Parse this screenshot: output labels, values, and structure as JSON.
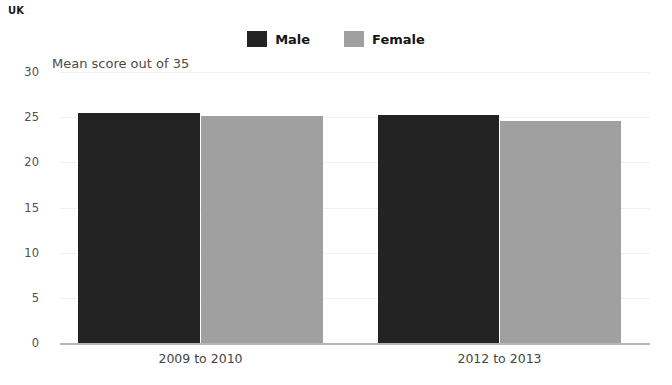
{
  "region_label": "UK",
  "legend": {
    "position": "top-center",
    "entries": [
      {
        "label": "Male",
        "color": "#232323",
        "icon": "square-swatch-icon"
      },
      {
        "label": "Female",
        "color": "#a0a0a0",
        "icon": "square-swatch-icon"
      }
    ]
  },
  "axis_note": "Mean score out of 35",
  "chart_data": {
    "type": "bar",
    "title": "UK",
    "subtitle": "Mean score out of 35",
    "xlabel": "",
    "ylabel": "Mean score out of 35",
    "categories": [
      "2009 to 2010",
      "2012 to 2013"
    ],
    "series": [
      {
        "name": "Male",
        "color": "#232323",
        "values": [
          25.5,
          25.2
        ]
      },
      {
        "name": "Female",
        "color": "#a0a0a0",
        "values": [
          25.1,
          24.6
        ]
      }
    ],
    "ylim": [
      0,
      30
    ],
    "yticks": [
      0,
      5,
      10,
      15,
      20,
      25,
      30
    ],
    "ytick_labels": [
      "0",
      "5",
      "10",
      "15",
      "20",
      "25",
      "30"
    ],
    "grid": true,
    "legend_position": "top-center"
  }
}
